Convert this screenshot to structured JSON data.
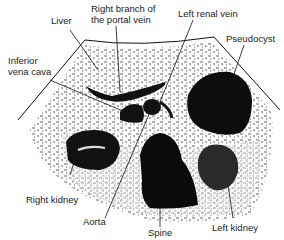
{
  "figure": {
    "type": "ultrasound-transverse-section-diagram",
    "labels": {
      "liver": "Liver",
      "portal_vein_line1": "Right branch of",
      "portal_vein_line2": "the portal vein",
      "left_renal_vein": "Left renal vein",
      "pseudocyst": "Pseudocyst",
      "ivc_line1": "Inferior",
      "ivc_line2": "vena cava",
      "right_kidney": "Right kidney",
      "aorta": "Aorta",
      "spine": "Spine",
      "left_kidney": "Left kidney"
    },
    "colors": {
      "ink": "#111111",
      "background": "#ffffff",
      "text": "#222222"
    }
  }
}
